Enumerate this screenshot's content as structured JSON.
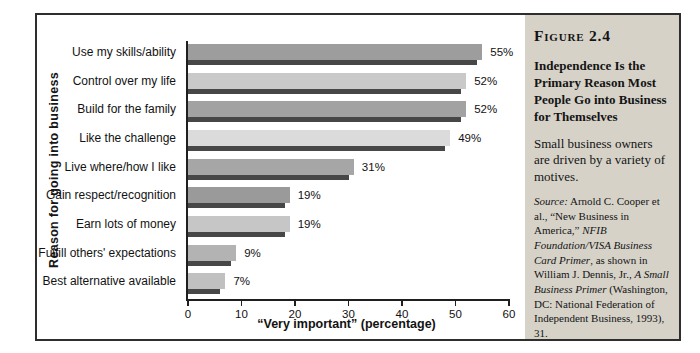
{
  "figure_panel": {
    "label": "Figure 2.4",
    "title": "Independence Is the Primary Reason Most People Go into Business for Themselves",
    "subtitle": "Small business owners are driven by a variety of motives.",
    "source_segments": [
      {
        "text": "Source:",
        "italic": true
      },
      {
        "text": " Arnold C. Cooper et al., “New Business in America,” ",
        "italic": false
      },
      {
        "text": "NFIB Foundation/VISA Business Card Primer",
        "italic": true
      },
      {
        "text": ", as shown in William J. Dennis, Jr., ",
        "italic": false
      },
      {
        "text": "A Small Business Primer",
        "italic": true
      },
      {
        "text": " (Washington, DC: National Federation of Independent Business, 1993), 31.",
        "italic": false
      }
    ],
    "background": "#d6d2c8"
  },
  "chart_data": {
    "type": "bar",
    "orientation": "horizontal",
    "categories": [
      "Use my skills/ability",
      "Control over my life",
      "Build for the family",
      "Like the challenge",
      "Live where/how I like",
      "Gain respect/recognition",
      "Earn lots of money",
      "Fulfill others' expectations",
      "Best alternative available"
    ],
    "values": [
      55,
      52,
      52,
      49,
      31,
      19,
      19,
      9,
      7
    ],
    "value_labels": [
      "55%",
      "52%",
      "52%",
      "49%",
      "31%",
      "19%",
      "19%",
      "9%",
      "7%"
    ],
    "xlabel": "“Very important” (percentage)",
    "ylabel": "Reason for going into business",
    "xlim": [
      0,
      60
    ],
    "xticks": [
      0,
      10,
      20,
      30,
      40,
      50,
      60
    ],
    "grid": false,
    "legend": false,
    "bar_colors": [
      "#9d9d9d",
      "#c9c9c9",
      "#a2a2a2",
      "#dbdbdb",
      "#a6a6a6",
      "#9a9a9a",
      "#c6c6c6",
      "#b3b3b3",
      "#c0c0c0"
    ],
    "bar_shadow_color": "#474747",
    "axis_color": "#1f1f1f"
  }
}
